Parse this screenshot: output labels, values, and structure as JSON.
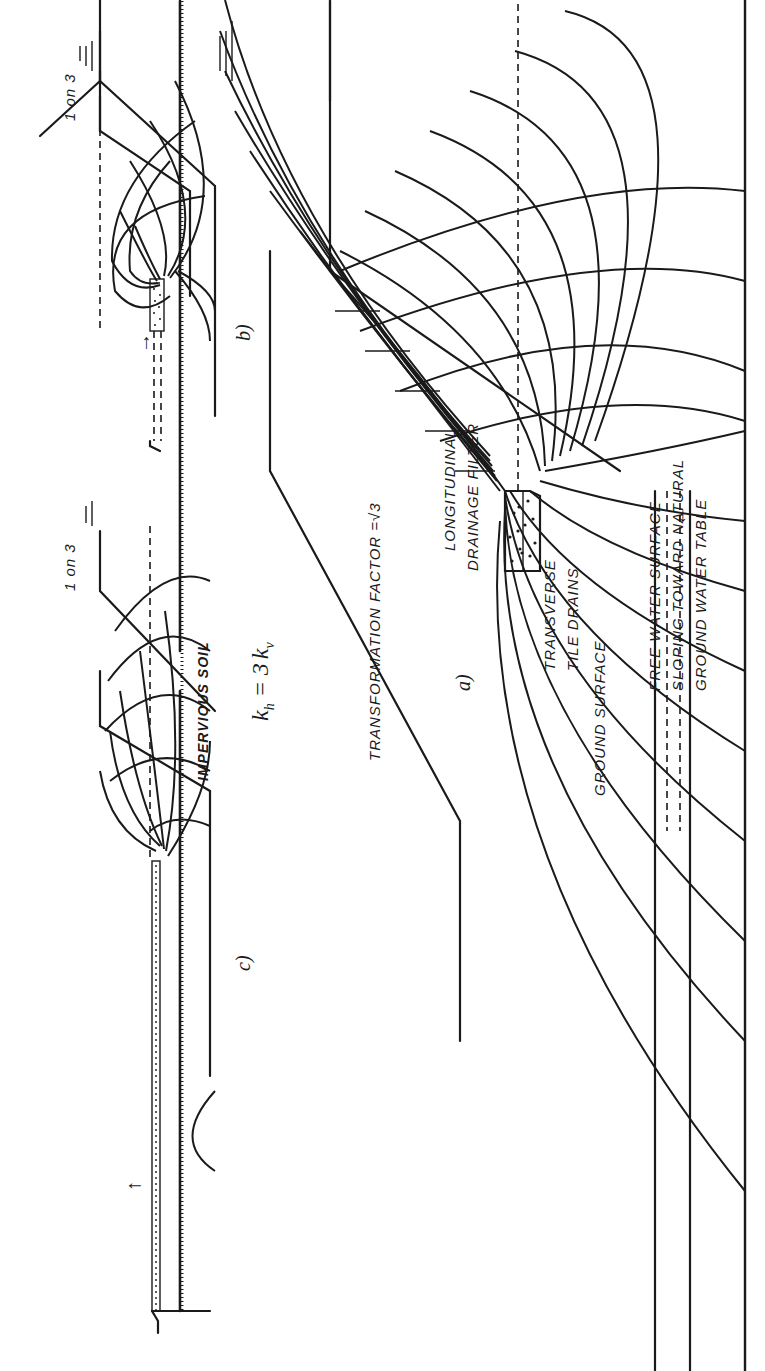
{
  "figure": {
    "orientation": "rotated -90deg (text reads bottom-to-top)",
    "equation": "k_h = 3 k_v",
    "equation_parts": {
      "kh": "k",
      "kh_sub": "h",
      "eq": " = 3",
      "kv": "k",
      "kv_sub": "v"
    },
    "panels": [
      {
        "id": "a",
        "tag": "a)",
        "title": "TRANSFORMATION  FACTOR  =√3",
        "labels": {
          "filter": [
            "LONGITUDINAL",
            "DRAINAGE FILTER"
          ],
          "tile": [
            "TRANSVERSE",
            "TILE DRAINS"
          ],
          "ground": "GROUND SURFACE",
          "water": [
            "FREE  WATER  SURFACE",
            "SLOPING  TOWARD  NATURAL",
            "GROUND  WATER  TABLE"
          ]
        }
      },
      {
        "id": "b",
        "tag": "b)",
        "slope": "1 on 3",
        "base_label": "IMPERVIOUS  SOIL"
      },
      {
        "id": "c",
        "tag": "c)",
        "slope": "1 on 3"
      }
    ]
  },
  "colors": {
    "ink": "#1a1a1a",
    "paper": "#ffffff"
  }
}
